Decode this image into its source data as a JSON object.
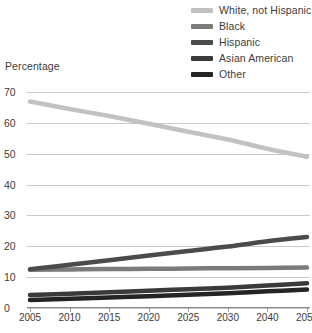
{
  "axis_title": "Percentage",
  "legend": {
    "position": "top-right",
    "items": [
      {
        "label": "White, not Hispanic",
        "color": "#c2c2c2"
      },
      {
        "label": "Black",
        "color": "#7b7b7b"
      },
      {
        "label": "Hispanic",
        "color": "#4b4b4b"
      },
      {
        "label": "Asian American",
        "color": "#3a3a3a"
      },
      {
        "label": "Other",
        "color": "#242424"
      }
    ]
  },
  "chart_data": {
    "type": "line",
    "title": "",
    "xlabel": "",
    "ylabel": "Percentage",
    "ylim": [
      0,
      70
    ],
    "ytick_step": 10,
    "grid": true,
    "legend_position": "top-right",
    "categories": [
      "2005",
      "2010",
      "2015",
      "2020",
      "2025",
      "2030",
      "2040",
      "2050"
    ],
    "yticks": [
      "0",
      "10",
      "20",
      "30",
      "40",
      "50",
      "60",
      "70"
    ],
    "series": [
      {
        "name": "White, not Hispanic",
        "color": "#c2c2c2",
        "values": [
          66.9,
          64.5,
          62.2,
          59.7,
          57.1,
          54.6,
          51.6,
          49.0
        ]
      },
      {
        "name": "Black",
        "color": "#7b7b7b",
        "values": [
          12.4,
          12.5,
          12.6,
          12.7,
          12.8,
          12.9,
          13.0,
          13.1
        ]
      },
      {
        "name": "Hispanic",
        "color": "#4b4b4b",
        "values": [
          12.6,
          14.0,
          15.5,
          17.0,
          18.5,
          19.9,
          21.6,
          23.0
        ]
      },
      {
        "name": "Asian American",
        "color": "#3a3a3a",
        "values": [
          4.2,
          4.6,
          5.1,
          5.6,
          6.1,
          6.6,
          7.3,
          8.0
        ]
      },
      {
        "name": "Other",
        "color": "#242424",
        "values": [
          2.6,
          3.0,
          3.4,
          3.8,
          4.3,
          4.8,
          5.4,
          6.0
        ]
      }
    ]
  }
}
